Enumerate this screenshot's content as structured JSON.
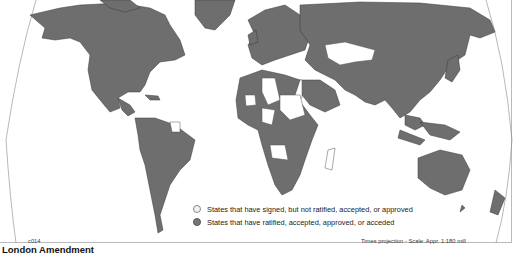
{
  "map": {
    "title": "London Amendment",
    "code": "c014",
    "projection_note": "Times projection - Scale: Appr. 1:180 mill",
    "colors": {
      "ratified": "#6e6e6e",
      "signed_not_ratified": "#ffffff",
      "borders": "#3a3a3a"
    }
  },
  "legend": {
    "items": [
      {
        "label": "States that have signed, but not ratified, accepted, or approved",
        "symbol": "light-circle"
      },
      {
        "label": "States that have ratified, accepted, approved, or acceded",
        "symbol": "dark-circle"
      }
    ]
  }
}
